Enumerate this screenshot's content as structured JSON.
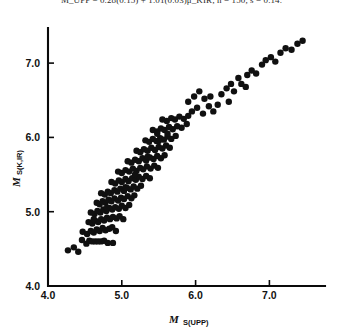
{
  "header": {
    "equation_text": "M_UPP =  0.28(0.15) + 1.01(0.03)μ_KIR;   n = 150, s = 0.14."
  },
  "chart_data": {
    "type": "scatter",
    "title": "",
    "xlabel": "M_S(UPP)",
    "ylabel": "M_S(K,IR)",
    "xlabel_main": "M",
    "xlabel_sub": "S(UPP)",
    "ylabel_main": "M",
    "ylabel_sub": "S(K,IR)",
    "xlim": [
      4.0,
      7.75
    ],
    "ylim": [
      4.0,
      7.6
    ],
    "xticks": [
      4.0,
      5.0,
      6.0,
      7.0
    ],
    "yticks": [
      4.0,
      5.0,
      6.0,
      7.0
    ],
    "xticklabels": [
      "4.0",
      "5.0",
      "6.0",
      "7.0"
    ],
    "yticklabels": [
      "4.0",
      "5.0",
      "6.0",
      "7.0"
    ],
    "grid": false,
    "legend": null,
    "marker": "filled-circle",
    "marker_color": "#101010",
    "marker_size": 3.2,
    "n_points": 178,
    "points": [
      [
        4.27,
        4.48
      ],
      [
        4.35,
        4.52
      ],
      [
        4.41,
        4.46
      ],
      [
        4.46,
        4.62
      ],
      [
        4.52,
        4.57
      ],
      [
        4.56,
        4.61
      ],
      [
        4.6,
        4.6
      ],
      [
        4.64,
        4.6
      ],
      [
        4.68,
        4.6
      ],
      [
        4.72,
        4.6
      ],
      [
        4.76,
        4.61
      ],
      [
        4.81,
        4.58
      ],
      [
        4.88,
        4.58
      ],
      [
        4.47,
        4.73
      ],
      [
        4.53,
        4.7
      ],
      [
        4.58,
        4.74
      ],
      [
        4.62,
        4.72
      ],
      [
        4.66,
        4.76
      ],
      [
        4.7,
        4.74
      ],
      [
        4.74,
        4.78
      ],
      [
        4.78,
        4.75
      ],
      [
        4.83,
        4.77
      ],
      [
        4.87,
        4.79
      ],
      [
        4.92,
        4.74
      ],
      [
        4.55,
        4.86
      ],
      [
        4.6,
        4.84
      ],
      [
        4.64,
        4.88
      ],
      [
        4.68,
        4.86
      ],
      [
        4.72,
        4.9
      ],
      [
        4.76,
        4.88
      ],
      [
        4.8,
        4.92
      ],
      [
        4.84,
        4.9
      ],
      [
        4.88,
        4.93
      ],
      [
        4.93,
        4.91
      ],
      [
        4.97,
        4.94
      ],
      [
        5.02,
        4.9
      ],
      [
        4.58,
        4.99
      ],
      [
        4.63,
        4.97
      ],
      [
        4.67,
        5.01
      ],
      [
        4.71,
        4.99
      ],
      [
        4.75,
        5.03
      ],
      [
        4.79,
        5.01
      ],
      [
        4.83,
        5.05
      ],
      [
        4.87,
        5.03
      ],
      [
        4.91,
        5.06
      ],
      [
        4.96,
        5.04
      ],
      [
        5.0,
        5.08
      ],
      [
        5.05,
        5.05
      ],
      [
        5.1,
        5.09
      ],
      [
        4.66,
        5.12
      ],
      [
        4.7,
        5.1
      ],
      [
        4.74,
        5.14
      ],
      [
        4.78,
        5.12
      ],
      [
        4.82,
        5.16
      ],
      [
        4.86,
        5.14
      ],
      [
        4.9,
        5.18
      ],
      [
        4.95,
        5.15
      ],
      [
        4.99,
        5.19
      ],
      [
        5.03,
        5.17
      ],
      [
        5.08,
        5.21
      ],
      [
        5.13,
        5.18
      ],
      [
        5.17,
        5.22
      ],
      [
        4.72,
        5.25
      ],
      [
        4.77,
        5.23
      ],
      [
        4.81,
        5.27
      ],
      [
        4.85,
        5.25
      ],
      [
        4.9,
        5.29
      ],
      [
        4.94,
        5.27
      ],
      [
        4.98,
        5.31
      ],
      [
        5.03,
        5.28
      ],
      [
        5.07,
        5.32
      ],
      [
        5.12,
        5.3
      ],
      [
        5.16,
        5.34
      ],
      [
        5.21,
        5.31
      ],
      [
        5.26,
        5.35
      ],
      [
        4.86,
        5.4
      ],
      [
        4.91,
        5.38
      ],
      [
        4.96,
        5.42
      ],
      [
        5.0,
        5.4
      ],
      [
        5.05,
        5.44
      ],
      [
        5.09,
        5.41
      ],
      [
        5.14,
        5.45
      ],
      [
        5.19,
        5.43
      ],
      [
        5.23,
        5.47
      ],
      [
        5.28,
        5.44
      ],
      [
        5.33,
        5.48
      ],
      [
        5.38,
        5.45
      ],
      [
        4.95,
        5.54
      ],
      [
        5.0,
        5.52
      ],
      [
        5.05,
        5.56
      ],
      [
        5.1,
        5.54
      ],
      [
        5.15,
        5.58
      ],
      [
        5.2,
        5.55
      ],
      [
        5.25,
        5.59
      ],
      [
        5.29,
        5.57
      ],
      [
        5.34,
        5.61
      ],
      [
        5.39,
        5.58
      ],
      [
        5.44,
        5.62
      ],
      [
        5.49,
        5.59
      ],
      [
        5.08,
        5.68
      ],
      [
        5.13,
        5.66
      ],
      [
        5.18,
        5.7
      ],
      [
        5.23,
        5.68
      ],
      [
        5.28,
        5.72
      ],
      [
        5.33,
        5.69
      ],
      [
        5.38,
        5.73
      ],
      [
        5.43,
        5.71
      ],
      [
        5.48,
        5.75
      ],
      [
        5.53,
        5.72
      ],
      [
        5.58,
        5.76
      ],
      [
        5.2,
        5.82
      ],
      [
        5.25,
        5.8
      ],
      [
        5.3,
        5.84
      ],
      [
        5.35,
        5.82
      ],
      [
        5.4,
        5.86
      ],
      [
        5.45,
        5.83
      ],
      [
        5.5,
        5.87
      ],
      [
        5.55,
        5.85
      ],
      [
        5.6,
        5.89
      ],
      [
        5.65,
        5.86
      ],
      [
        5.32,
        5.96
      ],
      [
        5.37,
        5.94
      ],
      [
        5.42,
        5.98
      ],
      [
        5.47,
        5.95
      ],
      [
        5.52,
        5.99
      ],
      [
        5.57,
        5.97
      ],
      [
        5.62,
        6.01
      ],
      [
        5.67,
        5.98
      ],
      [
        5.73,
        6.02
      ],
      [
        5.42,
        6.1
      ],
      [
        5.48,
        6.08
      ],
      [
        5.53,
        6.12
      ],
      [
        5.58,
        6.1
      ],
      [
        5.64,
        6.14
      ],
      [
        5.69,
        6.11
      ],
      [
        5.75,
        6.15
      ],
      [
        5.81,
        6.13
      ],
      [
        5.55,
        6.24
      ],
      [
        5.61,
        6.22
      ],
      [
        5.67,
        6.26
      ],
      [
        5.72,
        6.24
      ],
      [
        5.78,
        6.28
      ],
      [
        5.84,
        6.25
      ],
      [
        5.9,
        6.29
      ],
      [
        5.48,
        6.05
      ],
      [
        5.18,
        5.5
      ],
      [
        5.05,
        5.33
      ],
      [
        4.8,
        5.05
      ],
      [
        4.62,
        4.9
      ],
      [
        5.35,
        5.74
      ],
      [
        5.5,
        5.95
      ],
      [
        5.62,
        6.05
      ],
      [
        5.88,
        6.18
      ],
      [
        5.95,
        6.35
      ],
      [
        6.02,
        6.4
      ],
      [
        6.1,
        6.32
      ],
      [
        6.18,
        6.42
      ],
      [
        6.24,
        6.35
      ],
      [
        6.12,
        6.52
      ],
      [
        6.2,
        6.55
      ],
      [
        5.98,
        6.55
      ],
      [
        5.9,
        6.48
      ],
      [
        6.05,
        6.62
      ],
      [
        6.35,
        6.58
      ],
      [
        6.42,
        6.66
      ],
      [
        6.48,
        6.72
      ],
      [
        6.52,
        6.62
      ],
      [
        6.58,
        6.8
      ],
      [
        6.62,
        6.72
      ],
      [
        6.7,
        6.84
      ],
      [
        6.76,
        6.9
      ],
      [
        6.82,
        6.86
      ],
      [
        6.9,
        6.98
      ],
      [
        6.95,
        7.04
      ],
      [
        7.02,
        7.08
      ],
      [
        7.08,
        7.02
      ],
      [
        7.15,
        7.14
      ],
      [
        7.22,
        7.2
      ],
      [
        7.3,
        7.18
      ],
      [
        7.38,
        7.26
      ],
      [
        7.45,
        7.3
      ],
      [
        6.45,
        6.48
      ],
      [
        6.3,
        6.44
      ],
      [
        6.68,
        6.68
      ]
    ]
  }
}
